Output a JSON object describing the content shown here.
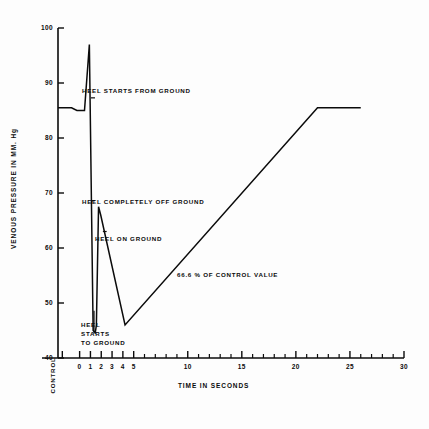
{
  "chart_data": {
    "type": "line",
    "title": "",
    "xlabel": "TIME IN SECONDS",
    "ylabel": "VENOUS PRESSURE IN MM. Hg",
    "xlim": [
      -2,
      30
    ],
    "ylim": [
      40,
      100
    ],
    "grid": false,
    "legend": "none",
    "yticks": [
      100,
      90,
      80,
      70,
      60,
      50,
      40
    ],
    "ytick_labels": [
      "100",
      "90",
      "80",
      "70",
      "60",
      "50",
      "40"
    ],
    "xticks": [
      -1.6,
      0,
      1,
      2,
      3,
      4,
      5,
      10,
      15,
      20,
      25,
      30
    ],
    "xtick_labels": [
      "CONTROL",
      "0",
      "1",
      "2",
      "3",
      "4",
      "5",
      "10",
      "15",
      "20",
      "25",
      "30"
    ],
    "xminor_ticks": [
      6,
      7,
      8,
      9,
      11,
      12,
      13,
      14,
      16,
      17,
      18,
      19,
      21,
      22,
      23,
      24,
      26,
      27,
      28,
      29
    ],
    "series": [
      {
        "name": "venous pressure",
        "x": [
          -2.0,
          -0.75,
          -0.25,
          0.45,
          0.9,
          1.25,
          1.45,
          1.55,
          1.75,
          1.95,
          4.2,
          22.0,
          26.0
        ],
        "y": [
          85.5,
          85.5,
          85.0,
          85.0,
          97.0,
          45.0,
          44.6,
          46.0,
          67.5,
          66.0,
          46.0,
          85.5,
          85.5
        ]
      }
    ],
    "annotations": [
      {
        "id": "heel-starts-from-ground",
        "text": "HEEL STARTS FROM GROUND",
        "x": 1.35,
        "y": 87.3
      },
      {
        "id": "heel-completely-off-ground",
        "text": "HEEL COMPLETELY OFF GROUND",
        "x": 1.35,
        "y": 68.6
      },
      {
        "id": "heel-on-ground",
        "text": "HEEL ON GROUND",
        "x": 2.45,
        "y": 63.0
      },
      {
        "id": "heel-starts-to-ground",
        "text": "HEEL\nSTARTS\nTO GROUND",
        "x": 1.55,
        "y": 47.5
      },
      {
        "id": "control-value-percent",
        "text": "66.6 % OF CONTROL VALUE",
        "x": 9.6,
        "y": 57.3
      }
    ]
  },
  "annotation_lines": {
    "heel_starts_from_ground": "HEEL STARTS FROM GROUND",
    "heel_completely_off_ground": "HEEL COMPLETELY OFF GROUND",
    "heel_on_ground": "HEEL ON GROUND",
    "heel_starts_1": "HEEL",
    "heel_starts_2": "STARTS",
    "heel_starts_3": "TO GROUND",
    "control_value_percent": "66.6 % OF CONTROL VALUE"
  },
  "style": {
    "line_color": "#0b0b0b",
    "axis_color": "#0b0b0b",
    "background": "#fdfdfd"
  }
}
